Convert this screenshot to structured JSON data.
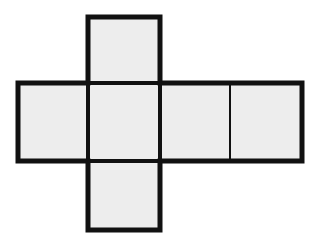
{
  "figure": {
    "name": "cube-net-diagram",
    "canvas": {
      "width": 320,
      "height": 245,
      "background": "#ffffff"
    },
    "style": {
      "face_fill": "#ededed",
      "outline_color": "#111111",
      "outline_width": 5,
      "inner_line_width": 4,
      "thin_divider_width": 2
    },
    "faces": [
      {
        "id": "face-top",
        "label": "top",
        "x": 88,
        "y": 17,
        "width": 72,
        "height": 66
      },
      {
        "id": "face-row-left",
        "label": "left",
        "x": 18,
        "y": 83,
        "width": 70,
        "height": 78
      },
      {
        "id": "face-row-center",
        "label": "front",
        "x": 88,
        "y": 83,
        "width": 72,
        "height": 78
      },
      {
        "id": "face-row-right",
        "label": "right",
        "x": 160,
        "y": 83,
        "width": 70,
        "height": 78
      },
      {
        "id": "face-row-far-right",
        "label": "back",
        "x": 230,
        "y": 83,
        "width": 72,
        "height": 78
      },
      {
        "id": "face-bottom",
        "label": "bottom",
        "x": 88,
        "y": 161,
        "width": 72,
        "height": 69
      }
    ],
    "inner_lines": [
      {
        "id": "divider-top-center",
        "orientation": "horizontal",
        "x1": 88,
        "y1": 83,
        "x2": 160,
        "y2": 83,
        "weight": "thick"
      },
      {
        "id": "divider-center-bottom",
        "orientation": "horizontal",
        "x1": 88,
        "y1": 161,
        "x2": 160,
        "y2": 161,
        "weight": "thick"
      },
      {
        "id": "divider-left-center",
        "orientation": "vertical",
        "x1": 88,
        "y1": 83,
        "x2": 88,
        "y2": 161,
        "weight": "thick"
      },
      {
        "id": "divider-center-right",
        "orientation": "vertical",
        "x1": 160,
        "y1": 83,
        "x2": 160,
        "y2": 161,
        "weight": "thick"
      },
      {
        "id": "divider-right-far-right",
        "orientation": "vertical",
        "x1": 230,
        "y1": 83,
        "x2": 230,
        "y2": 161,
        "weight": "thin"
      }
    ],
    "outline_path": "M 88 17 L 160 17 L 160 83 L 302 83 L 302 161 L 160 161 L 160 230 L 88 230 L 88 161 L 18 161 L 18 83 L 88 83 Z",
    "counts": {
      "faces": 6,
      "rows": 3,
      "columns": 4
    }
  }
}
